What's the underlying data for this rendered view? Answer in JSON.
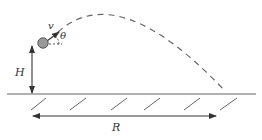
{
  "diagram": {
    "type": "projectile-motion",
    "labels": {
      "velocity": "v",
      "angle": "θ",
      "height": "H",
      "range": "R"
    },
    "colors": {
      "line": "#555555",
      "ball": "#999999",
      "ball_stroke": "#555555",
      "text": "#333333",
      "background": "#ffffff"
    },
    "ground": {
      "hatch_count": 6
    },
    "trajectory": {
      "style": "dashed"
    }
  }
}
